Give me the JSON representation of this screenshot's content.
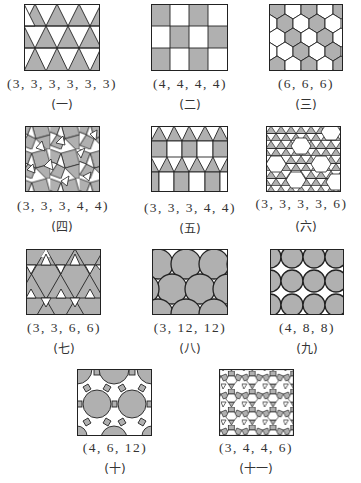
{
  "figure": {
    "fill_gray": "#b0b0b0",
    "line_color": "#222222",
    "panels": [
      {
        "id": "1",
        "notation": "(3, 3, 3, 3, 3, 3)",
        "index": "(一)",
        "pattern": "triangles"
      },
      {
        "id": "2",
        "notation": "(4, 4, 4, 4)",
        "index": "(二)",
        "pattern": "squares"
      },
      {
        "id": "3",
        "notation": "(6, 6, 6)",
        "index": "(三)",
        "pattern": "hexagons"
      },
      {
        "id": "4",
        "notation": "(3, 3, 3, 4, 4)",
        "index": "(四)",
        "pattern": "snub-square"
      },
      {
        "id": "5",
        "notation": "(3, 3, 3, 4, 4)",
        "index": "(五)",
        "pattern": "elongated-triangular"
      },
      {
        "id": "6",
        "notation": "(3, 3, 3, 3, 6)",
        "index": "(六)",
        "pattern": "snub-hexagonal"
      },
      {
        "id": "7",
        "notation": "(3, 3, 6, 6)",
        "index": "(七)",
        "pattern": "trihexagonal"
      },
      {
        "id": "8",
        "notation": "(3, 12, 12)",
        "index": "(八)",
        "pattern": "truncated-hexagonal"
      },
      {
        "id": "9",
        "notation": "(4, 8, 8)",
        "index": "(九)",
        "pattern": "truncated-square"
      },
      {
        "id": "10",
        "notation": "(4, 6, 12)",
        "index": "(十)",
        "pattern": "truncated-trihexagonal"
      },
      {
        "id": "11",
        "notation": "(3, 4, 4, 6)",
        "index": "(十一)",
        "pattern": "rhombitrihexagonal"
      }
    ]
  }
}
